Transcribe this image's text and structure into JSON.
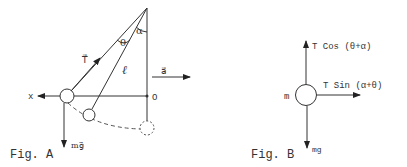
{
  "figure_a": {
    "caption": "Fig. A",
    "labels": {
      "tension": "T⃗",
      "length": "ℓ",
      "theta": "θ",
      "alpha": "α",
      "acceleration": "a⃗",
      "x_axis": "x",
      "origin": "O",
      "weight": "mg⃗"
    }
  },
  "figure_b": {
    "caption": "Fig. B",
    "labels": {
      "mass": "m",
      "vertical_force": "T Cos (θ+α)",
      "horizontal_force": "T Sin (α+θ)",
      "weight": "mg"
    }
  },
  "colors": {
    "line": "#333333",
    "background": "#ffffff"
  }
}
